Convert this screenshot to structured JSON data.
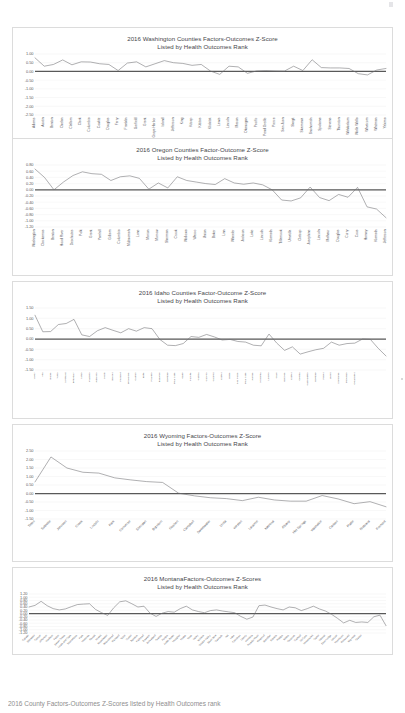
{
  "document": {
    "type": "scanned-report-page",
    "footer_note": "2016 County Factors-Outcomes Z-Scores listed by Health Outcomes rank"
  },
  "charts": [
    {
      "id": "washington",
      "title_line1": "2016 Washington Counties  Factors-Outcomes Z-Score",
      "title_line2": "Listed by Health Outcomes Rank",
      "chart_data": {
        "type": "line",
        "title": "2016 Washington Counties Factors-Outcomes Z-Score",
        "subtitle": "Listed by Health Outcomes Rank",
        "xlabel": "",
        "ylabel": "",
        "ylim": [
          -2.5,
          1.0
        ],
        "yticks": [
          "1.00",
          "0.50",
          "0.00",
          "-0.50",
          "-1.00",
          "-1.50",
          "-2.00",
          "-2.50"
        ],
        "grid": true,
        "legend": "none",
        "reference_line": 0.0,
        "categories": [
          "Adams",
          "Asotin",
          "Benton",
          "Chelan",
          "Clallam",
          "Clark",
          "Columbia",
          "Cowlitz",
          "Douglas",
          "Ferry",
          "Franklin",
          "Garfield",
          "Grant",
          "Grays Harbor",
          "Island",
          "Jefferson",
          "King",
          "Kitsap",
          "Kittitas",
          "Klickitat",
          "Lewis",
          "Lincoln",
          "Mason",
          "Okanogan",
          "Pacific",
          "Pend Oreille",
          "Pierce",
          "San Juan",
          "Skagit",
          "Skamania",
          "Snohomish",
          "Spokane",
          "Stevens",
          "Thurston",
          "Wahkiakum",
          "Walla Walla",
          "Whatcom",
          "Whitman",
          "Yakima"
        ],
        "values": [
          0.78,
          0.3,
          0.4,
          0.66,
          0.38,
          0.55,
          0.54,
          0.44,
          0.4,
          0.05,
          0.48,
          0.55,
          0.26,
          0.44,
          0.62,
          0.5,
          0.46,
          0.35,
          0.4,
          0.02,
          -0.17,
          0.3,
          0.26,
          -0.11,
          0.03,
          0.05,
          0.03,
          0.02,
          0.3,
          0.05,
          0.67,
          0.22,
          0.2,
          0.2,
          0.17,
          -0.13,
          -0.2,
          0.08,
          0.17
        ]
      }
    },
    {
      "id": "oregon",
      "title_line1": "2016 Oregon Counties  Factor-Outcome Z-Score",
      "title_line2": "Listed by Health Outcomes Rank",
      "chart_data": {
        "type": "line",
        "title": "2016 Oregon Counties Factor-Outcome Z-Score",
        "subtitle": "Listed by Health Outcomes Rank",
        "xlabel": "",
        "ylabel": "",
        "ylim": [
          -1.2,
          0.8
        ],
        "yticks": [
          "0.80",
          "0.60",
          "0.40",
          "0.20",
          "0.00",
          "-0.20",
          "-0.40",
          "-0.60",
          "-0.80",
          "-1.00",
          "-1.20"
        ],
        "grid": true,
        "legend": "none",
        "reference_line": 0.0,
        "categories": [
          "Washington",
          "Clackamas",
          "Benton",
          "Hood River",
          "Deschutes",
          "Polk",
          "Grant",
          "Yamhill",
          "Gilliam",
          "Columbia",
          "Multnomah",
          "Lane",
          "Marion",
          "Morrow",
          "Sherman",
          "Crook",
          "Wallowa",
          "Wasco",
          "Union",
          "Baker",
          "Linn",
          "Wheeler",
          "Jackson",
          "Lake",
          "Lincoln",
          "Klamath",
          "Tillamook",
          "Umatilla",
          "Clatsop",
          "Josephine",
          "Lincoln",
          "Malheur",
          "Douglas",
          "Curry",
          "Coos",
          "Harney",
          "Klamath",
          "Jefferson"
        ],
        "values": [
          0.67,
          0.4,
          0.0,
          0.25,
          0.46,
          0.58,
          0.52,
          0.5,
          0.3,
          0.42,
          0.45,
          0.37,
          0.02,
          0.22,
          0.06,
          0.42,
          0.3,
          0.25,
          0.2,
          0.17,
          0.36,
          0.22,
          0.18,
          0.22,
          0.16,
          0.0,
          -0.33,
          -0.36,
          -0.26,
          0.09,
          -0.25,
          -0.35,
          -0.15,
          -0.24,
          0.08,
          -0.55,
          -0.62,
          -0.9
        ]
      }
    },
    {
      "id": "idaho",
      "title_line1": "2016 Idaho Counties  Factor-Outcome Z-Score",
      "title_line2": "Listed by Health Outcomes Rank",
      "chart_data": {
        "type": "line",
        "title": "2016 Idaho Counties Factor-Outcome Z-Score",
        "subtitle": "Listed by Health Outcomes Rank",
        "xlabel": "",
        "ylabel": "",
        "ylim": [
          -1.5,
          1.5
        ],
        "yticks": [
          "1.50",
          "1.00",
          "0.50",
          "0.00",
          "-0.50",
          "-1.00",
          "-1.50"
        ],
        "grid": true,
        "legend": "none",
        "reference_line": 0.0,
        "categories": [
          "Valley",
          "Ada",
          "Blaine",
          "Teton",
          "Kootenai",
          "Boundary",
          "Latah",
          "Madison",
          "Jefferson",
          "Lewis",
          "Bonner",
          "Fremont",
          "Bonneville",
          "Camas",
          "Butte",
          "Franklin",
          "Bannock",
          "Gooding",
          "Bear Lake",
          "Idaho",
          "Payette",
          "Cassia",
          "Canyon",
          "Caribou",
          "Custer",
          "Boise",
          "Nez Perce",
          "Bear Lake",
          "Jerome",
          "Minidoka",
          "Lincoln",
          "Clark",
          "Owyhee",
          "Custer",
          "Oneida",
          "Washington",
          "Gooding",
          "Power",
          "Lemhi",
          "Shoshone",
          "Benewah",
          "Clearwater"
        ],
        "values": [
          1.15,
          0.35,
          0.36,
          0.7,
          0.75,
          0.95,
          0.2,
          0.12,
          0.4,
          0.55,
          0.42,
          0.3,
          0.5,
          0.38,
          0.55,
          0.5,
          -0.02,
          -0.3,
          -0.32,
          -0.22,
          0.12,
          0.08,
          0.22,
          0.1,
          -0.05,
          -0.02,
          -0.12,
          -0.15,
          -0.3,
          -0.33,
          0.24,
          -0.2,
          -0.55,
          -0.38,
          -0.73,
          -0.62,
          -0.52,
          -0.45,
          -0.15,
          -0.3,
          -0.22,
          -0.2,
          0.0,
          -0.02,
          -0.45,
          -0.82
        ]
      }
    },
    {
      "id": "wyoming",
      "title_line1": "2016 Wyoming Factors-Outcomes Z-Score",
      "title_line2": "Listed by Health Outcomes Rank",
      "chart_data": {
        "type": "line",
        "title": "2016 Wyoming Factors-Outcomes Z-Score",
        "subtitle": "Listed by Health Outcomes Rank",
        "xlabel": "",
        "ylabel": "",
        "ylim": [
          -1.5,
          2.5
        ],
        "yticks": [
          "2.50",
          "2.00",
          "1.50",
          "1.00",
          "0.50",
          "0.00",
          "-0.50",
          "-1.00",
          "-1.50"
        ],
        "grid": true,
        "legend": "none",
        "reference_line": 0.0,
        "categories": [
          "Teton",
          "Sublette",
          "Johnson",
          "Crook",
          "Lincoln",
          "Park",
          "Converse",
          "Sheridan",
          "Big Horn",
          "Goshen",
          "Campbell",
          "Sweetwater",
          "Uinta",
          "Weston",
          "Laramie",
          "Natrona",
          "Albany",
          "Hot Springs",
          "Washakie",
          "Carbon",
          "Platte",
          "Niobrara",
          "Fremont"
        ],
        "values": [
          0.68,
          2.15,
          1.5,
          1.25,
          1.2,
          0.92,
          0.8,
          0.7,
          0.65,
          0.02,
          -0.14,
          -0.25,
          -0.3,
          -0.42,
          -0.22,
          -0.38,
          -0.45,
          -0.45,
          -0.12,
          -0.32,
          -0.6,
          -0.48,
          -0.78
        ]
      }
    },
    {
      "id": "montana",
      "title_line1": "2016 MontanaFactors-Outcomes Z-Scores",
      "title_line2": "Listed by Health Outcomes Rank",
      "chart_data": {
        "type": "line",
        "title": "2016 Montana Factors-Outcomes Z-Scores",
        "subtitle": "Listed by Health Outcomes Rank",
        "xlabel": "",
        "ylabel": "",
        "ylim": [
          -1.2,
          1.2
        ],
        "yticks": [
          "1.20",
          "1.00",
          "0.80",
          "0.60",
          "0.40",
          "0.20",
          "0.00",
          "-0.20",
          "-0.40",
          "-0.60",
          "-0.80",
          "-1.00",
          "-1.20"
        ],
        "grid": true,
        "legend": "none",
        "reference_line": 0.0,
        "categories": [
          "Gallatin",
          "Stillwater",
          "Carbon",
          "Jefferson",
          "Madison",
          "Fallon",
          "Sweet Grass",
          "Lewis and Clark",
          "Yellowstone",
          "Park",
          "Missoula",
          "Ravalli",
          "Powell",
          "Broadwater",
          "Beaverhead",
          "Richland",
          "Teton",
          "Custer",
          "Sanders",
          "Flathead",
          "Dawson",
          "Wheatland",
          "Granite",
          "Fergus",
          "Judith Basin",
          "Meagher",
          "Prairie",
          "Toole",
          "Valley",
          "Wibaux",
          "Golden Valley",
          "Silver Bow",
          "Cascade",
          "Hill",
          "Lake",
          "Chouteau",
          "Liberty",
          "Pondera",
          "Powder River",
          "Rosebud",
          "Sheridan",
          "Daniels",
          "Phillips",
          "Blaine",
          "Treasure",
          "Garfield",
          "McCone",
          "Musselshell",
          "Carter",
          "Mineral",
          "Deer Lodge",
          "Lincoln",
          "Petroleum",
          "Roosevelt",
          "Big Horn",
          "Glacier"
        ],
        "values": [
          0.4,
          0.5,
          0.75,
          0.48,
          0.3,
          0.22,
          0.28,
          0.42,
          0.55,
          0.58,
          0.6,
          0.25,
          0.05,
          -0.12,
          0.35,
          0.72,
          0.78,
          0.6,
          0.4,
          0.45,
          0.02,
          -0.18,
          0.02,
          0.12,
          0.08,
          0.3,
          0.45,
          0.22,
          0.12,
          0.05,
          0.18,
          0.22,
          0.15,
          0.1,
          0.05,
          -0.18,
          -0.35,
          -0.22,
          0.48,
          0.52,
          0.4,
          0.3,
          0.22,
          0.4,
          0.35,
          0.18,
          0.3,
          0.45,
          0.28,
          0.15,
          -0.05,
          -0.3,
          -0.58,
          -0.42,
          -0.55,
          -0.52,
          -0.55,
          -0.2,
          -0.1,
          -0.75
        ]
      }
    }
  ]
}
